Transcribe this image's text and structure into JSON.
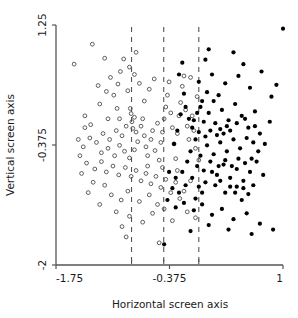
{
  "chart_data": {
    "type": "scatter",
    "title": "",
    "xlabel": "Horizontal screen axis",
    "ylabel": "Vertical screen axis",
    "xlim": [
      -1.75,
      1.0
    ],
    "ylim": [
      -2.0,
      1.25
    ],
    "xticks": [
      -1.75,
      -0.375,
      1.0
    ],
    "xticklabels": [
      "-1.75",
      "-0.375",
      "1"
    ],
    "yticks": [
      -2.0,
      -0.375,
      1.25
    ],
    "yticklabels": [
      "-2",
      "-0.375",
      "1.25"
    ],
    "minor_xticks": [
      -0.835,
      -0.445,
      -0.02
    ],
    "grid": false,
    "legend": false,
    "vlines": {
      "x": [
        -0.835,
        -0.445,
        -0.02
      ],
      "style": "dashed",
      "color": "#555555"
    },
    "series": [
      {
        "name": "open",
        "marker": "open-circle",
        "color": "#4d4d4d",
        "fill": "none",
        "points": [
          [
            -1.53,
            0.72
          ],
          [
            -1.31,
            0.99
          ],
          [
            -1.24,
            0.43
          ],
          [
            -1.16,
            0.8
          ],
          [
            -1.09,
            0.54
          ],
          [
            -1.01,
            0.12
          ],
          [
            -1.22,
            0.18
          ],
          [
            -1.4,
            0.02
          ],
          [
            -1.33,
            -0.1
          ],
          [
            -1.12,
            -0.02
          ],
          [
            -1.05,
            0.3
          ],
          [
            -0.97,
            0.62
          ],
          [
            -0.93,
            0.79
          ],
          [
            -0.88,
            0.36
          ],
          [
            -0.85,
            0.12
          ],
          [
            -0.84,
            0.05
          ],
          [
            -0.83,
            -0.06
          ],
          [
            -0.82,
            -0.15
          ],
          [
            -0.8,
            0.0
          ],
          [
            -0.78,
            -0.2
          ],
          [
            -0.9,
            -0.12
          ],
          [
            -0.95,
            -0.25
          ],
          [
            -1.02,
            -0.18
          ],
          [
            -1.1,
            -0.3
          ],
          [
            -1.18,
            -0.22
          ],
          [
            -1.26,
            -0.34
          ],
          [
            -1.34,
            -0.28
          ],
          [
            -1.42,
            -0.4
          ],
          [
            -1.2,
            -0.48
          ],
          [
            -1.12,
            -0.42
          ],
          [
            -1.04,
            -0.52
          ],
          [
            -0.98,
            -0.38
          ],
          [
            -0.92,
            -0.46
          ],
          [
            -0.86,
            -0.55
          ],
          [
            -0.8,
            -0.44
          ],
          [
            -0.76,
            -0.33
          ],
          [
            -0.72,
            -0.12
          ],
          [
            -0.7,
            -0.02
          ],
          [
            -0.68,
            -0.25
          ],
          [
            -0.66,
            -0.4
          ],
          [
            -0.64,
            -0.52
          ],
          [
            -0.6,
            -0.3
          ],
          [
            -0.58,
            -0.18
          ],
          [
            -0.55,
            -0.45
          ],
          [
            -0.52,
            -0.08
          ],
          [
            -0.5,
            -0.58
          ],
          [
            -0.48,
            -0.34
          ],
          [
            -0.46,
            -0.2
          ],
          [
            -0.44,
            -0.02
          ],
          [
            -0.42,
            0.14
          ],
          [
            -0.4,
            0.3
          ],
          [
            -0.38,
            0.48
          ],
          [
            -0.36,
            0.06
          ],
          [
            -0.34,
            -0.14
          ],
          [
            -0.32,
            -0.36
          ],
          [
            -0.3,
            -0.56
          ],
          [
            -0.28,
            -0.22
          ],
          [
            -0.26,
            0.02
          ],
          [
            -0.24,
            0.2
          ],
          [
            -0.22,
            0.42
          ],
          [
            -0.2,
            0.56
          ],
          [
            -0.18,
            0.1
          ],
          [
            -0.16,
            -0.12
          ],
          [
            -0.14,
            -0.3
          ],
          [
            -0.12,
            0.54
          ],
          [
            -0.1,
            0.02
          ],
          [
            -0.08,
            -0.18
          ],
          [
            -0.06,
            -0.42
          ],
          [
            -0.04,
            0.28
          ],
          [
            -0.02,
            -0.58
          ],
          [
            -1.46,
            -0.52
          ],
          [
            -1.38,
            -0.62
          ],
          [
            -1.28,
            -0.7
          ],
          [
            -1.2,
            -0.6
          ],
          [
            -1.14,
            -0.74
          ],
          [
            -1.06,
            -0.66
          ],
          [
            -0.99,
            -0.78
          ],
          [
            -0.91,
            -0.68
          ],
          [
            -0.84,
            -0.8
          ],
          [
            -0.78,
            -0.72
          ],
          [
            -0.72,
            -0.86
          ],
          [
            -0.66,
            -0.76
          ],
          [
            -0.6,
            -0.9
          ],
          [
            -0.54,
            -0.8
          ],
          [
            -0.48,
            -0.95
          ],
          [
            -0.42,
            -0.84
          ],
          [
            -0.36,
            -1.02
          ],
          [
            -0.3,
            -0.88
          ],
          [
            -0.25,
            -1.1
          ],
          [
            -0.52,
            -1.18
          ],
          [
            -0.62,
            -1.05
          ],
          [
            -0.74,
            -1.14
          ],
          [
            -0.88,
            -1.0
          ],
          [
            -0.96,
            -1.12
          ],
          [
            -1.08,
            -1.05
          ],
          [
            -1.02,
            -1.28
          ],
          [
            -0.86,
            -1.34
          ],
          [
            -0.7,
            -1.42
          ],
          [
            -0.58,
            -1.3
          ],
          [
            -0.95,
            -1.48
          ],
          [
            -1.16,
            -0.92
          ],
          [
            -1.3,
            -0.88
          ],
          [
            -1.36,
            -1.02
          ],
          [
            -1.22,
            -1.18
          ],
          [
            -1.44,
            -0.76
          ],
          [
            -1.48,
            -0.3
          ],
          [
            -1.4,
            -0.14
          ],
          [
            -0.9,
            -1.62
          ],
          [
            -0.5,
            -1.7
          ],
          [
            -0.68,
            0.22
          ],
          [
            -0.62,
            0.38
          ],
          [
            -0.56,
            0.52
          ],
          [
            -0.74,
            0.46
          ],
          [
            -0.8,
            0.58
          ],
          [
            -0.86,
            0.68
          ],
          [
            -1.0,
            0.45
          ],
          [
            -0.44,
            -1.24
          ],
          [
            -0.34,
            -1.4
          ],
          [
            -0.16,
            -1.28
          ],
          [
            -0.06,
            -1.36
          ],
          [
            -0.78,
            0.88
          ],
          [
            -1.14,
            0.35
          ],
          [
            -0.98,
            -0.02
          ],
          [
            -0.64,
            -0.66
          ],
          [
            -0.46,
            -0.68
          ],
          [
            -0.28,
            -0.72
          ],
          [
            -0.12,
            -0.86
          ],
          [
            -0.2,
            -1.0
          ]
        ]
      },
      {
        "name": "filled",
        "marker": "filled-circle",
        "color": "#000000",
        "fill": "solid",
        "points": [
          [
            1.0,
            1.2
          ],
          [
            0.86,
            0.28
          ],
          [
            0.74,
            0.62
          ],
          [
            0.6,
            0.4
          ],
          [
            0.52,
            0.72
          ],
          [
            0.4,
            0.88
          ],
          [
            0.3,
            0.46
          ],
          [
            0.22,
            0.3
          ],
          [
            0.14,
            0.58
          ],
          [
            0.06,
            0.78
          ],
          [
            -0.02,
            0.48
          ],
          [
            0.02,
            0.22
          ],
          [
            0.1,
            0.06
          ],
          [
            0.18,
            -0.08
          ],
          [
            0.26,
            0.1
          ],
          [
            0.34,
            -0.04
          ],
          [
            0.42,
            0.18
          ],
          [
            0.5,
            0.02
          ],
          [
            0.58,
            -0.14
          ],
          [
            0.66,
            0.08
          ],
          [
            0.72,
            -0.22
          ],
          [
            0.64,
            -0.34
          ],
          [
            0.56,
            -0.28
          ],
          [
            0.48,
            -0.42
          ],
          [
            0.4,
            -0.3
          ],
          [
            0.32,
            -0.46
          ],
          [
            0.24,
            -0.34
          ],
          [
            0.16,
            -0.5
          ],
          [
            0.08,
            -0.38
          ],
          [
            0.0,
            -0.52
          ],
          [
            -0.06,
            -0.3
          ],
          [
            -0.1,
            -0.14
          ],
          [
            -0.14,
            -0.02
          ],
          [
            -0.18,
            0.14
          ],
          [
            -0.2,
            0.32
          ],
          [
            -0.24,
            0.04
          ],
          [
            -0.28,
            -0.18
          ],
          [
            -0.32,
            -0.36
          ],
          [
            -0.12,
            -0.46
          ],
          [
            -0.04,
            -0.66
          ],
          [
            0.04,
            -0.72
          ],
          [
            0.12,
            -0.6
          ],
          [
            0.2,
            -0.78
          ],
          [
            0.28,
            -0.64
          ],
          [
            0.36,
            -0.82
          ],
          [
            0.44,
            -0.7
          ],
          [
            0.52,
            -0.86
          ],
          [
            0.6,
            -0.74
          ],
          [
            0.68,
            -0.6
          ],
          [
            0.76,
            -0.78
          ],
          [
            0.7,
            -0.46
          ],
          [
            0.62,
            -0.56
          ],
          [
            0.54,
            -0.62
          ],
          [
            0.46,
            -0.56
          ],
          [
            0.38,
            -0.66
          ],
          [
            0.3,
            -0.58
          ],
          [
            0.22,
            -0.66
          ],
          [
            0.14,
            -0.74
          ],
          [
            0.06,
            -0.88
          ],
          [
            -0.02,
            -0.94
          ],
          [
            -0.1,
            -0.82
          ],
          [
            -0.18,
            -0.92
          ],
          [
            -0.26,
            -1.02
          ],
          [
            -0.34,
            -0.96
          ],
          [
            -0.4,
            -1.12
          ],
          [
            -0.3,
            -1.22
          ],
          [
            -0.2,
            -1.16
          ],
          [
            -0.08,
            -1.26
          ],
          [
            0.02,
            -1.18
          ],
          [
            0.14,
            -1.32
          ],
          [
            0.26,
            -1.24
          ],
          [
            0.4,
            -1.38
          ],
          [
            0.56,
            -1.3
          ],
          [
            0.72,
            -1.44
          ],
          [
            0.88,
            -1.52
          ],
          [
            0.62,
            -1.58
          ],
          [
            0.34,
            -1.52
          ],
          [
            0.1,
            -1.46
          ],
          [
            -0.12,
            -1.54
          ],
          [
            -0.44,
            -1.72
          ],
          [
            -0.26,
            0.58
          ],
          [
            -0.22,
            0.74
          ],
          [
            0.1,
            0.92
          ],
          [
            0.46,
            0.56
          ],
          [
            -0.16,
            -0.6
          ],
          [
            -0.22,
            -0.74
          ],
          [
            -0.3,
            -0.82
          ],
          [
            -0.38,
            -0.74
          ],
          [
            -0.08,
            -0.04
          ],
          [
            0.0,
            0.14
          ],
          [
            0.08,
            0.34
          ],
          [
            0.16,
            0.22
          ],
          [
            0.24,
            -0.16
          ],
          [
            0.32,
            -0.12
          ],
          [
            0.44,
            -0.08
          ],
          [
            0.54,
            -0.02
          ],
          [
            0.66,
            -0.12
          ],
          [
            0.78,
            -0.36
          ],
          [
            0.84,
            -0.06
          ],
          [
            0.92,
            0.44
          ],
          [
            0.18,
            -0.92
          ],
          [
            0.3,
            -1.02
          ],
          [
            0.44,
            -0.94
          ],
          [
            0.5,
            -1.12
          ],
          [
            -0.02,
            -0.2
          ],
          [
            0.06,
            -0.26
          ],
          [
            0.12,
            -0.18
          ],
          [
            0.2,
            -0.24
          ],
          [
            0.28,
            -0.22
          ],
          [
            0.36,
            -0.18
          ],
          [
            0.04,
            -0.06
          ],
          [
            -0.04,
            0.06
          ],
          [
            0.42,
            -1.02
          ],
          [
            0.58,
            -1.04
          ],
          [
            0.24,
            -0.86
          ],
          [
            0.02,
            -1.02
          ],
          [
            -0.06,
            -1.1
          ],
          [
            0.36,
            -0.94
          ],
          [
            0.52,
            -0.96
          ],
          [
            0.64,
            -0.92
          ]
        ]
      }
    ]
  }
}
